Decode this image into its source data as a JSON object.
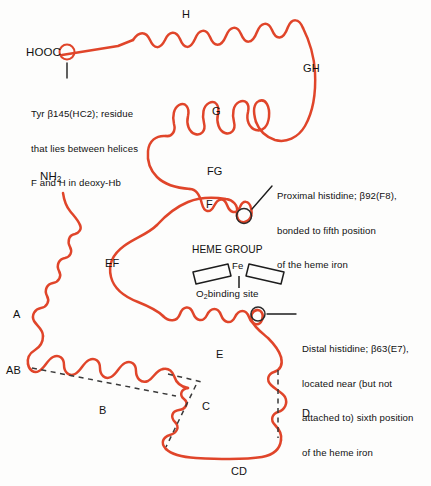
{
  "figure": {
    "chain_color": "#e0452a",
    "axis_color": "#3a3a3a",
    "text_color": "#111111",
    "background": "#fdfdfc"
  },
  "termini": {
    "c_terminus": "HOOC",
    "n_terminus_text": "NH",
    "n_terminus_sub": "2"
  },
  "helices": [
    {
      "id": "H",
      "label": "H"
    },
    {
      "id": "GH",
      "label": "GH"
    },
    {
      "id": "G",
      "label": "G"
    },
    {
      "id": "FG",
      "label": "FG"
    },
    {
      "id": "F",
      "label": "F"
    },
    {
      "id": "EF",
      "label": "EF"
    },
    {
      "id": "E",
      "label": "E"
    },
    {
      "id": "D",
      "label": "D"
    },
    {
      "id": "CD",
      "label": "CD"
    },
    {
      "id": "C",
      "label": "C"
    },
    {
      "id": "B",
      "label": "B"
    },
    {
      "id": "AB",
      "label": "AB"
    },
    {
      "id": "A",
      "label": "A"
    }
  ],
  "annotations": {
    "tyr": {
      "line1": "Tyr β145(HC2); residue",
      "line2": "that lies between helices",
      "line3": "F and H in deoxy-Hb"
    },
    "proximal": {
      "line1": "Proximal histidine; β92(F8),",
      "line2": "bonded to fifth position",
      "line3": "of the heme iron"
    },
    "distal": {
      "line1": "Distal histidine; β63(E7),",
      "line2": "located near (but not",
      "line3": "attached to) sixth position",
      "line4": "of the heme iron"
    }
  },
  "heme": {
    "group_label": "HEME GROUP",
    "iron_label": "Fe",
    "binding_site_text": "binding site",
    "binding_site_prefix": "O",
    "binding_site_sub": "2"
  }
}
